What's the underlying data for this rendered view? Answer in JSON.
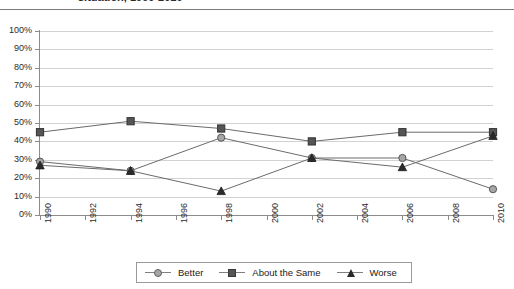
{
  "title": {
    "text": "situation, 1990-2010",
    "clipped": true
  },
  "chart_data": {
    "type": "line",
    "title": "situation, 1990-2010",
    "xlabel": "",
    "ylabel": "",
    "x": [
      1990,
      1994,
      1998,
      2002,
      2006,
      2010
    ],
    "series": [
      {
        "name": "Better",
        "marker": "circle",
        "values": [
          29,
          24,
          42,
          31,
          31,
          14
        ]
      },
      {
        "name": "About the Same",
        "marker": "square",
        "values": [
          45,
          51,
          47,
          40,
          45,
          45
        ]
      },
      {
        "name": "Worse",
        "marker": "triangle",
        "values": [
          27,
          24,
          13,
          31,
          26,
          43
        ]
      }
    ],
    "ylim": [
      0,
      100
    ],
    "yticks": [
      0,
      10,
      20,
      30,
      40,
      50,
      60,
      70,
      80,
      90,
      100
    ],
    "ytick_labels": [
      "0%",
      "10%",
      "20%",
      "30%",
      "40%",
      "50%",
      "60%",
      "70%",
      "80%",
      "90%",
      "100%"
    ],
    "xticks": [
      1990,
      1992,
      1994,
      1996,
      1998,
      2000,
      2002,
      2004,
      2006,
      2008,
      2010
    ],
    "xtick_labels": [
      "1990",
      "1992",
      "1994",
      "1996",
      "1998",
      "2000",
      "2002",
      "2004",
      "2006",
      "2008",
      "2010"
    ],
    "xtick_rotation": 90,
    "grid": "horizontal",
    "legend_position": "bottom"
  },
  "legend": {
    "items": [
      {
        "label": "Better",
        "marker": "circle-marker"
      },
      {
        "label": "About the Same",
        "marker": "square-marker"
      },
      {
        "label": "Worse",
        "marker": "triangle-marker"
      }
    ]
  },
  "colors": {
    "better": "#a6a6a6",
    "about_the_same": "#555555",
    "worse": "#2b2b2b",
    "line": "#6b6b6b",
    "grid": "#d2d2d2",
    "axis": "#8c8c8c",
    "background": "#ffffff"
  }
}
